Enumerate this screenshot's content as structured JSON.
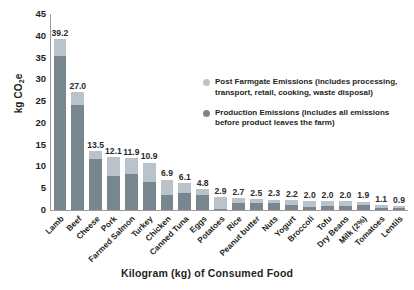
{
  "chart": {
    "type": "bar",
    "y_axis_title_main": "kg CO",
    "y_axis_title_sub": "2",
    "y_axis_title_tail": "e",
    "x_axis_title": "Kilogram (kg) of Consumed Food"
  },
  "legend": {
    "items": [
      {
        "label": "Post Farmgate Emissions (includes processing, transport, retail, cooking, waste disposal)",
        "color": "#b9c3c9"
      },
      {
        "label": "Production Emissions (includes all emissions before product leaves the farm)",
        "color": "#78878f"
      }
    ]
  },
  "chart_data": {
    "type": "bar",
    "stacked": true,
    "title": "",
    "xlabel": "Kilogram (kg) of Consumed Food",
    "ylabel": "kg CO2e",
    "ylim": [
      0,
      45
    ],
    "yticks": [
      0,
      5,
      10,
      15,
      20,
      25,
      30,
      35,
      40,
      45
    ],
    "grid": false,
    "legend_position": "inside-upper-right",
    "categories": [
      "Lamb",
      "Beef",
      "Cheese",
      "Pork",
      "Farmed Salmon",
      "Turkey",
      "Chicken",
      "Canned Tuna",
      "Eggs",
      "Potatoes",
      "Rice",
      "Peanut butter",
      "Nuts",
      "Yogurt",
      "Broccoli",
      "Tofu",
      "Dry Beans",
      "Milk (2%)",
      "Tomatoes",
      "Lentils"
    ],
    "totals": [
      39.2,
      27.0,
      13.5,
      12.1,
      11.9,
      10.9,
      6.9,
      6.1,
      4.8,
      2.9,
      2.7,
      2.5,
      2.3,
      2.2,
      2.0,
      2.0,
      2.0,
      1.9,
      1.1,
      0.9
    ],
    "data_labels": [
      "39.2",
      "27.0",
      "13.5",
      "12.1",
      "11.9",
      "10.9",
      "6.9",
      "6.1",
      "4.8",
      "2.9",
      "2.7",
      "2.5",
      "2.3",
      "2.2",
      "2.0",
      "2.0",
      "2.0",
      "1.9",
      "1.1",
      "0.9"
    ],
    "series": [
      {
        "name": "Production Emissions (includes all emissions before product leaves the farm)",
        "color": "#78878f",
        "values": [
          35.4,
          24.2,
          11.6,
          7.9,
          8.2,
          6.4,
          3.4,
          3.9,
          3.5,
          0.3,
          1.7,
          1.6,
          1.5,
          1.2,
          0.8,
          0.9,
          0.9,
          1.1,
          0.5,
          0.4
        ]
      },
      {
        "name": "Post Farmgate Emissions (includes processing, transport, retail, cooking, waste disposal)",
        "color": "#b9c3c9",
        "values": [
          3.8,
          2.8,
          1.9,
          4.2,
          3.7,
          4.5,
          3.5,
          2.2,
          1.3,
          2.6,
          1.0,
          0.9,
          0.8,
          1.0,
          1.2,
          1.1,
          1.1,
          0.8,
          0.6,
          0.5
        ]
      }
    ]
  }
}
